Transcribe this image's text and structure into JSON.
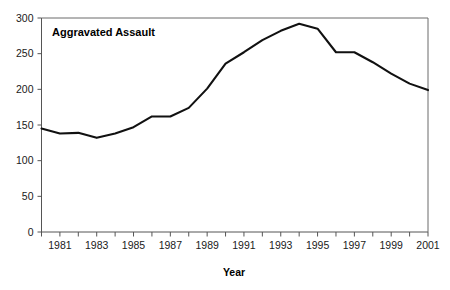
{
  "figure": {
    "cut_off_header": "",
    "series_label": "Aggravated Assault",
    "xlabel": "Year",
    "ylabel": ""
  },
  "axis": {
    "y_ticks": [
      "0",
      "50",
      "100",
      "150",
      "200",
      "250",
      "300"
    ],
    "x_ticks": [
      "1981",
      "1983",
      "1985",
      "1987",
      "1989",
      "1991",
      "1993",
      "1995",
      "1997",
      "1999",
      "2001"
    ]
  },
  "chart_data": {
    "type": "line",
    "title": "Aggravated Assault",
    "xlabel": "Year",
    "ylabel": "",
    "grid": false,
    "legend_position": "inside-top-left",
    "xlim": [
      1980,
      2001
    ],
    "ylim": [
      0,
      300
    ],
    "x": [
      1980,
      1981,
      1982,
      1983,
      1984,
      1985,
      1986,
      1987,
      1988,
      1989,
      1990,
      1991,
      1992,
      1993,
      1994,
      1995,
      1996,
      1997,
      1998,
      1999,
      2000,
      2001
    ],
    "series": [
      {
        "name": "Aggravated Assault",
        "color": "#111111",
        "values": [
          145,
          138,
          139,
          132,
          138,
          147,
          162,
          162,
          174,
          201,
          236,
          252,
          269,
          282,
          292,
          285,
          252,
          252,
          238,
          222,
          208,
          199
        ]
      }
    ],
    "x_tick_labels": [
      "1981",
      "1983",
      "1985",
      "1987",
      "1989",
      "1991",
      "1993",
      "1995",
      "1997",
      "1999",
      "2001"
    ],
    "x_tick_values": [
      1981,
      1983,
      1985,
      1987,
      1989,
      1991,
      1993,
      1995,
      1997,
      1999,
      2001
    ],
    "y_tick_values": [
      0,
      50,
      100,
      150,
      200,
      250,
      300
    ],
    "annotations": [
      {
        "text": "Aggravated Assault",
        "x": 1981,
        "y": 285
      }
    ]
  }
}
